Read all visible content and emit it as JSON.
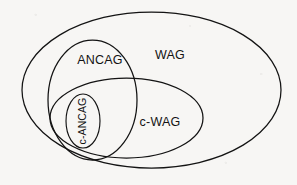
{
  "figure": {
    "kind": "euler-diagram",
    "background_color": "#f7f6f4",
    "stroke_color": "#131313",
    "text_color": "#131313"
  },
  "sets": {
    "wag": {
      "label": "WAG",
      "role": "outermost-set",
      "label_x": 170,
      "label_y": 56,
      "cx": 151.5,
      "cy": 90,
      "rx": 129.5,
      "ry": 78
    },
    "ancag": {
      "label": "ANCAG",
      "role": "upper-left-subset",
      "label_x": 100,
      "label_y": 61,
      "cx": 92.5,
      "cy": 100,
      "rx": 44.5,
      "ry": 60
    },
    "c_wag": {
      "label": "c-WAG",
      "role": "lower-subset",
      "label_x": 160,
      "label_y": 123,
      "cx": 126.5,
      "cy": 118,
      "rx": 76.5,
      "ry": 40
    },
    "c_ancag": {
      "label": "c-ANCAG",
      "role": "innermost-intersection-subset",
      "label_x": 83,
      "label_y": 121,
      "label_rotation": -90,
      "cx": 83,
      "cy": 121,
      "rx": 17,
      "ry": 27
    }
  }
}
